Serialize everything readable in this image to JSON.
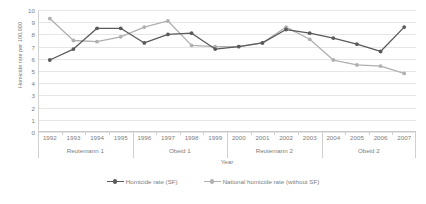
{
  "chart_data": {
    "type": "line",
    "title": "",
    "xlabel": "Year",
    "ylabel": "Homicide rate per 100,000",
    "ylim": [
      0,
      10
    ],
    "ytick_labels": [
      "0",
      "1",
      "2",
      "3",
      "4",
      "5",
      "6",
      "7",
      "8",
      "9",
      "10"
    ],
    "grid": true,
    "legend_position": "bottom",
    "categories": [
      "1992",
      "1993",
      "1994",
      "1995",
      "1996",
      "1997",
      "1998",
      "1999",
      "2000",
      "2001",
      "2002",
      "2003",
      "2004",
      "2005",
      "2006",
      "2007"
    ],
    "x": [
      1992,
      1993,
      1994,
      1995,
      1996,
      1997,
      1998,
      1999,
      2000,
      2001,
      2002,
      2003,
      2004,
      2005,
      2006,
      2007
    ],
    "series": [
      {
        "name": "Homicide rate (SF)",
        "color": "#5a5a5a",
        "values": [
          5.9,
          6.8,
          8.5,
          8.5,
          7.3,
          8.0,
          8.1,
          6.8,
          7.0,
          7.3,
          8.4,
          8.1,
          7.7,
          7.2,
          6.6,
          8.6
        ]
      },
      {
        "name": "National homicide rate (without SF)",
        "color": "#b0b0b0",
        "values": [
          9.3,
          7.5,
          7.4,
          7.8,
          8.6,
          9.1,
          7.1,
          7.0,
          7.0,
          7.3,
          8.6,
          7.6,
          5.9,
          5.5,
          5.4,
          4.8
        ]
      }
    ],
    "period_groups": [
      {
        "label": "Reutemann 1",
        "start": "1992",
        "end": "1995"
      },
      {
        "label": "Obeid 1",
        "start": "1996",
        "end": "1999"
      },
      {
        "label": "Reutemann 2",
        "start": "1999",
        "end": "2003"
      },
      {
        "label": "Obeid 2",
        "start": "2004",
        "end": "2007"
      }
    ]
  },
  "axis": {
    "y_title": "Homicide rate per 100,000",
    "x_title": "Year"
  },
  "legend": {
    "items": [
      {
        "label": "Homicide rate (SF)"
      },
      {
        "label": "National homicide rate (without SF)"
      }
    ]
  }
}
